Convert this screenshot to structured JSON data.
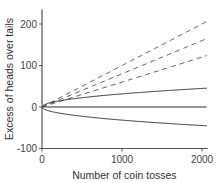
{
  "chart_data": {
    "type": "line",
    "title": "",
    "xlabel": "Number of coin tosses",
    "ylabel": "Excess of heads over tails",
    "xlim": [
      0,
      2060
    ],
    "ylim": [
      -100,
      235
    ],
    "xticks": [
      0,
      1000,
      2000
    ],
    "xtick_labels": [
      "0",
      "1000",
      "2000"
    ],
    "yticks": [
      -100,
      0,
      100,
      200
    ],
    "ytick_labels": [
      "-100",
      "0",
      "100",
      "200"
    ],
    "grid": false,
    "legend": "none",
    "x": [
      0,
      100,
      250,
      500,
      750,
      1000,
      1250,
      1500,
      1750,
      2060
    ],
    "series": [
      {
        "name": "0.10n",
        "style": "dashed",
        "values": [
          0,
          10,
          25,
          50,
          75,
          100,
          125,
          150,
          175,
          206
        ]
      },
      {
        "name": "0.08n",
        "style": "dashed",
        "values": [
          0,
          8,
          20,
          40,
          60,
          80,
          100,
          120,
          140,
          165
        ]
      },
      {
        "name": "0.06n",
        "style": "dashed",
        "values": [
          0,
          6,
          15,
          30,
          45,
          60,
          75,
          90,
          105,
          124
        ]
      },
      {
        "name": "+sqrt(n)",
        "style": "solid",
        "values": [
          0,
          10,
          15.8,
          22.4,
          27.4,
          31.6,
          35.4,
          38.7,
          41.8,
          45.4
        ]
      },
      {
        "name": "zero",
        "style": "solid",
        "values": [
          0,
          0,
          0,
          0,
          0,
          0,
          0,
          0,
          0,
          0
        ]
      },
      {
        "name": "-sqrt(n)",
        "style": "solid",
        "values": [
          0,
          -10,
          -15.8,
          -22.4,
          -27.4,
          -31.6,
          -35.4,
          -38.7,
          -41.8,
          -45.4
        ]
      }
    ]
  }
}
